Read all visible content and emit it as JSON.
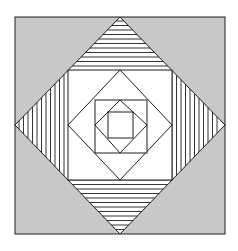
{
  "figure": {
    "width": 238,
    "height": 251,
    "background": "#ffffff",
    "colors": {
      "outer_fill": "#c8c8c8",
      "inner_fill": "#ffffff",
      "stroke": "#1e1e1e"
    },
    "outer_square": {
      "x1": 15,
      "y1": 17,
      "x2": 225,
      "y2": 234
    },
    "big_diamond": {
      "top": [
        120,
        17
      ],
      "right": [
        225,
        125
      ],
      "bottom": [
        120,
        234
      ],
      "left": [
        15,
        125
      ]
    },
    "square_1": {
      "x1": 68,
      "y1": 70,
      "x2": 172,
      "y2": 180
    },
    "diamond_2": {
      "top": [
        120,
        70
      ],
      "right": [
        172,
        125
      ],
      "bottom": [
        120,
        180
      ],
      "left": [
        68,
        125
      ]
    },
    "square_2": {
      "x1": 95,
      "y1": 100,
      "x2": 147,
      "y2": 153
    },
    "diamond_3": {
      "top": [
        120,
        100
      ],
      "right": [
        147,
        125
      ],
      "bottom": [
        120,
        153
      ],
      "left": [
        95,
        125
      ]
    },
    "square_3": {
      "x1": 108,
      "y1": 112,
      "x2": 133,
      "y2": 138
    },
    "hatching": {
      "top_triangle": {
        "direction": "horizontal",
        "from": 21,
        "to": 70,
        "step": 4.5
      },
      "bottom_triangle": {
        "direction": "horizontal",
        "from": 180,
        "to": 230,
        "step": 4.5
      },
      "left_triangle": {
        "direction": "vertical",
        "from": 19,
        "to": 68,
        "step": 4.5
      },
      "right_triangle": {
        "direction": "vertical",
        "from": 172,
        "to": 221,
        "step": 4.5
      }
    }
  }
}
